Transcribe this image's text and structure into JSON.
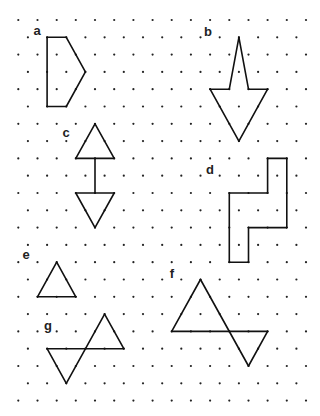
{
  "worksheet": {
    "background": "#ffffff",
    "ink_color": "#111111",
    "grid": {
      "type": "isometric-dots",
      "rows": 23,
      "row_origin_y": 20,
      "row_spacing": 17.3,
      "even_row_origin_x": 18.3,
      "odd_row_origin_x": 27.9,
      "col_spacing": 19.18,
      "even_row_count": 16,
      "odd_row_count": 15
    },
    "shapes": [
      {
        "id": "a",
        "label": "a",
        "label_pos": [
          37,
          31
        ],
        "segments": [
          [
            [
              1,
              1
            ],
            [
              1,
              2
            ]
          ],
          [
            [
              1,
              2
            ],
            [
              3,
              3
            ]
          ],
          [
            [
              3,
              3
            ],
            [
              5,
              2
            ]
          ],
          [
            [
              5,
              2
            ],
            [
              5,
              1
            ]
          ],
          [
            [
              5,
              1
            ],
            [
              1,
              1
            ]
          ]
        ]
      },
      {
        "id": "b",
        "label": "b",
        "label_pos": [
          208,
          32
        ],
        "segments": [
          [
            [
              1,
              11
            ],
            [
              4,
              11
            ]
          ],
          [
            [
              4,
              11
            ],
            [
              4,
              10
            ]
          ],
          [
            [
              4,
              10
            ],
            [
              7,
              11
            ]
          ],
          [
            [
              7,
              11
            ],
            [
              4,
              13
            ]
          ],
          [
            [
              4,
              13
            ],
            [
              4,
              12
            ]
          ],
          [
            [
              4,
              12
            ],
            [
              1,
              11
            ]
          ]
        ]
      },
      {
        "id": "c",
        "label": "c",
        "label_pos": [
          66,
          133
        ],
        "segments": [
          [
            [
              6,
              4
            ],
            [
              8,
              3
            ]
          ],
          [
            [
              8,
              3
            ],
            [
              8,
              5
            ]
          ],
          [
            [
              8,
              5
            ],
            [
              6,
              4
            ]
          ],
          [
            [
              8,
              4
            ],
            [
              10,
              4
            ]
          ],
          [
            [
              10,
              3
            ],
            [
              10,
              5
            ]
          ],
          [
            [
              10,
              5
            ],
            [
              12,
              4
            ]
          ],
          [
            [
              12,
              4
            ],
            [
              10,
              3
            ]
          ]
        ]
      },
      {
        "id": "d",
        "label": "d",
        "label_pos": [
          210,
          170
        ],
        "segments": [
          [
            [
              8,
              13
            ],
            [
              8,
              14
            ]
          ],
          [
            [
              8,
              14
            ],
            [
              12,
              14
            ]
          ],
          [
            [
              12,
              14
            ],
            [
              12,
              12
            ]
          ],
          [
            [
              12,
              12
            ],
            [
              14,
              12
            ]
          ],
          [
            [
              14,
              12
            ],
            [
              14,
              11
            ]
          ],
          [
            [
              14,
              11
            ],
            [
              10,
              11
            ]
          ],
          [
            [
              10,
              11
            ],
            [
              10,
              13
            ]
          ],
          [
            [
              10,
              13
            ],
            [
              8,
              13
            ]
          ]
        ]
      },
      {
        "id": "e",
        "label": "e",
        "label_pos": [
          26,
          255
        ],
        "segments": [
          [
            [
              14,
              2
            ],
            [
              16,
              1
            ]
          ],
          [
            [
              16,
              1
            ],
            [
              16,
              3
            ]
          ],
          [
            [
              16,
              3
            ],
            [
              14,
              2
            ]
          ]
        ]
      },
      {
        "id": "f",
        "label": "f",
        "label_pos": [
          172,
          274
        ],
        "segments": [
          [
            [
              15,
              9
            ],
            [
              18,
              8
            ]
          ],
          [
            [
              18,
              8
            ],
            [
              18,
              13
            ]
          ],
          [
            [
              18,
              13
            ],
            [
              20,
              12
            ]
          ],
          [
            [
              20,
              12
            ],
            [
              15,
              9
            ]
          ]
        ]
      },
      {
        "id": "g",
        "label": "g",
        "label_pos": [
          48,
          326
        ],
        "segments": [
          [
            [
              17,
              4
            ],
            [
              19,
              5
            ]
          ],
          [
            [
              19,
              5
            ],
            [
              19,
              1
            ]
          ],
          [
            [
              19,
              1
            ],
            [
              21,
              2
            ]
          ],
          [
            [
              21,
              2
            ],
            [
              17,
              4
            ]
          ]
        ]
      }
    ]
  }
}
